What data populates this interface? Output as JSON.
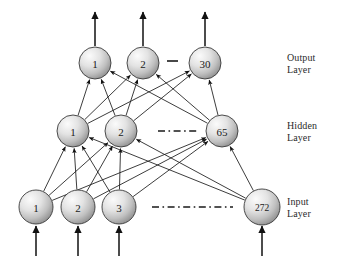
{
  "diagram": {
    "type": "feedforward-neural-network",
    "background_color": "#ffffff",
    "node_fill_light": "#f2f2f2",
    "node_fill_dark": "#9a9a9a",
    "node_stroke": "#3a3a3a",
    "edge_color": "#1a1a1a"
  },
  "layers": [
    {
      "id": "output",
      "caption": "Output\nLayer",
      "caption_line1": "Output",
      "caption_line2": "Layer",
      "nodes": [
        {
          "label": "1",
          "cx": 95,
          "cy": 63,
          "r": 16
        },
        {
          "label": "2",
          "cx": 143,
          "cy": 63,
          "r": 16
        },
        {
          "label": "30",
          "cx": 205,
          "cy": 63,
          "r": 16
        }
      ],
      "separator": {
        "type": "dash",
        "x1": 167,
        "x2": 178,
        "y": 61
      }
    },
    {
      "id": "hidden",
      "caption": "Hidden\nLayer",
      "caption_line1": "Hidden",
      "caption_line2": "Layer",
      "nodes": [
        {
          "label": "1",
          "cx": 73,
          "cy": 131,
          "r": 16
        },
        {
          "label": "2",
          "cx": 121,
          "cy": 131,
          "r": 16
        },
        {
          "label": "65",
          "cx": 222,
          "cy": 131,
          "r": 16
        }
      ],
      "separator": {
        "type": "dash-dot",
        "x1": 158,
        "x2": 198,
        "y": 131
      }
    },
    {
      "id": "input",
      "caption": "Input\nLayer",
      "caption_line1": "Input",
      "caption_line2": "Layer",
      "nodes": [
        {
          "label": "1",
          "cx": 36,
          "cy": 207,
          "r": 17
        },
        {
          "label": "2",
          "cx": 78,
          "cy": 207,
          "r": 17
        },
        {
          "label": "3",
          "cx": 119,
          "cy": 207,
          "r": 17
        },
        {
          "label": "272",
          "cx": 262,
          "cy": 207,
          "r": 18
        }
      ],
      "separator": {
        "type": "dash-dot",
        "x1": 152,
        "x2": 233,
        "y": 207
      }
    }
  ],
  "connections": {
    "input_to_hidden": [
      [
        0,
        0
      ],
      [
        0,
        1
      ],
      [
        0,
        2
      ],
      [
        1,
        0
      ],
      [
        1,
        1
      ],
      [
        1,
        2
      ],
      [
        2,
        0
      ],
      [
        2,
        1
      ],
      [
        2,
        2
      ],
      [
        3,
        0
      ],
      [
        3,
        1
      ],
      [
        3,
        2
      ]
    ],
    "hidden_to_output": [
      [
        0,
        0
      ],
      [
        0,
        1
      ],
      [
        0,
        2
      ],
      [
        1,
        0
      ],
      [
        1,
        1
      ],
      [
        1,
        2
      ],
      [
        2,
        0
      ],
      [
        2,
        1
      ],
      [
        2,
        2
      ]
    ]
  },
  "external_arrows": {
    "input_arrows_y_from": 256,
    "input_arrows_y_to": 226,
    "output_arrows_y_from": 46,
    "output_arrows_y_to": 12
  },
  "captions_position": {
    "output": {
      "x": 287,
      "y": 52
    },
    "hidden": {
      "x": 287,
      "y": 120
    },
    "input": {
      "x": 287,
      "y": 196
    }
  }
}
